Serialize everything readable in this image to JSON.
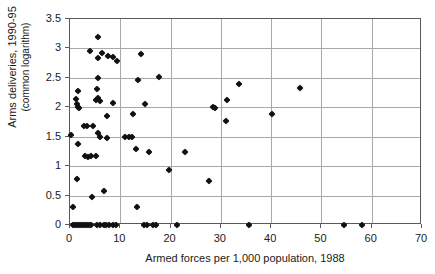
{
  "chart_data": {
    "type": "scatter",
    "title": "",
    "xlabel": "Armed forces per 1,000 population, 1988",
    "ylabel": "Arms deliveries, 1990-95",
    "ylabel_sub": "(common logarithm)",
    "xlim": [
      0,
      70
    ],
    "ylim": [
      0,
      3.5
    ],
    "xticks": [
      0,
      10,
      20,
      30,
      40,
      50,
      60,
      70
    ],
    "yticks": [
      0,
      0.5,
      1,
      1.5,
      2,
      2.5,
      3,
      3.5
    ],
    "xtick_labels": [
      "0",
      "10",
      "20",
      "30",
      "40",
      "50",
      "60",
      "70"
    ],
    "ytick_labels": [
      "0",
      "0.5",
      "1",
      "1.5",
      "2",
      "2.5",
      "3",
      "3.5"
    ],
    "grid": true,
    "grid_color": "#a8a8a8",
    "marker": "diamond",
    "marker_color": "#111111",
    "legend": null,
    "points": [
      [
        5.6,
        3.2
      ],
      [
        4.0,
        2.95
      ],
      [
        6.4,
        2.93
      ],
      [
        5.6,
        2.84
      ],
      [
        7.6,
        2.87
      ],
      [
        8.6,
        2.85
      ],
      [
        9.3,
        2.78
      ],
      [
        14.1,
        2.9
      ],
      [
        5.6,
        2.5
      ],
      [
        13.6,
        2.47
      ],
      [
        17.6,
        2.52
      ],
      [
        33.6,
        2.4
      ],
      [
        45.8,
        2.32
      ],
      [
        40.2,
        1.89
      ],
      [
        1.6,
        2.28
      ],
      [
        5.4,
        2.31
      ],
      [
        1.2,
        2.14
      ],
      [
        1.3,
        2.05
      ],
      [
        1.5,
        2.0
      ],
      [
        1.7,
        1.99
      ],
      [
        5.2,
        2.12
      ],
      [
        5.6,
        2.16
      ],
      [
        5.9,
        2.1
      ],
      [
        8.5,
        2.07
      ],
      [
        14.9,
        2.06
      ],
      [
        28.4,
        2.0
      ],
      [
        28.9,
        1.98
      ],
      [
        31.3,
        2.12
      ],
      [
        31.0,
        1.77
      ],
      [
        7.4,
        1.85
      ],
      [
        12.6,
        1.88
      ],
      [
        2.8,
        1.69
      ],
      [
        3.4,
        1.69
      ],
      [
        4.6,
        1.69
      ],
      [
        0.2,
        1.53
      ],
      [
        5.5,
        1.56
      ],
      [
        5.9,
        1.5
      ],
      [
        7.4,
        1.48
      ],
      [
        11.0,
        1.49
      ],
      [
        11.8,
        1.5
      ],
      [
        12.4,
        1.49
      ],
      [
        1.6,
        1.38
      ],
      [
        3.0,
        1.18
      ],
      [
        3.6,
        1.16
      ],
      [
        4.2,
        1.17
      ],
      [
        5.1,
        1.18
      ],
      [
        13.2,
        1.29
      ],
      [
        15.8,
        1.24
      ],
      [
        22.8,
        1.24
      ],
      [
        19.6,
        0.93
      ],
      [
        27.6,
        0.75
      ],
      [
        1.3,
        0.78
      ],
      [
        4.3,
        0.48
      ],
      [
        6.7,
        0.57
      ],
      [
        0.6,
        0.3
      ],
      [
        13.4,
        0.3
      ],
      [
        0.5,
        0.0
      ],
      [
        0.9,
        0.0
      ],
      [
        1.3,
        0.0
      ],
      [
        1.7,
        0.0
      ],
      [
        2.1,
        0.0
      ],
      [
        2.5,
        0.0
      ],
      [
        2.9,
        0.0
      ],
      [
        3.3,
        0.0
      ],
      [
        3.7,
        0.0
      ],
      [
        4.2,
        0.0
      ],
      [
        5.4,
        0.0
      ],
      [
        5.9,
        0.0
      ],
      [
        6.8,
        0.0
      ],
      [
        7.2,
        0.0
      ],
      [
        7.7,
        0.0
      ],
      [
        8.6,
        0.0
      ],
      [
        9.1,
        0.0
      ],
      [
        14.8,
        0.0
      ],
      [
        15.4,
        0.0
      ],
      [
        16.6,
        0.0
      ],
      [
        17.1,
        0.0
      ],
      [
        21.3,
        0.0
      ],
      [
        35.5,
        0.0
      ],
      [
        54.4,
        0.0
      ],
      [
        58.1,
        0.0
      ]
    ]
  }
}
